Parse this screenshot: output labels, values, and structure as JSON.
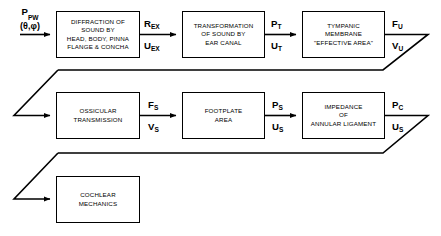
{
  "figure": {
    "background_color": "#ffffff",
    "line_color": "#000000"
  },
  "input": {
    "symbol": "P",
    "symbol_sub": "PW",
    "angles": "(θ,φ)"
  },
  "blocks": [
    {
      "id": "diffraction",
      "label": "DIFFRACTION OF\nSOUND BY\nHEAD, BODY, PINNA\nFLANGE & CONCHA",
      "row": 1
    },
    {
      "id": "transformation",
      "label": "TRANSFORMATION\nOF SOUND BY\nEAR CANAL",
      "row": 1
    },
    {
      "id": "tympanic-membrane",
      "label": "TYMPANIC\nMEMBRANE\n\"EFFECTIVE AREA\"",
      "row": 1
    },
    {
      "id": "ossicular-transmission",
      "label": "OSSICULAR\nTRANSMISSION",
      "row": 2
    },
    {
      "id": "footplate-area",
      "label": "FOOTPLATE\nAREA",
      "row": 2
    },
    {
      "id": "annular-ligament",
      "label": "IMPEDANCE\nOF\nANNULAR LIGAMENT",
      "row": 2
    },
    {
      "id": "cochlear-mechanics",
      "label": "COCHLEAR\nMECHANICS",
      "row": 3
    }
  ],
  "signals": [
    {
      "id": "r-ex",
      "top_symbol": "R",
      "top_sub": "EX",
      "bottom_symbol": "U",
      "bottom_sub": "EX"
    },
    {
      "id": "p-t",
      "top_symbol": "P",
      "top_sub": "T",
      "bottom_symbol": "U",
      "bottom_sub": "T"
    },
    {
      "id": "f-u",
      "top_symbol": "F",
      "top_sub": "U",
      "bottom_symbol": "V",
      "bottom_sub": "U"
    },
    {
      "id": "f-s",
      "top_symbol": "F",
      "top_sub": "S",
      "bottom_symbol": "V",
      "bottom_sub": "S"
    },
    {
      "id": "p-s",
      "top_symbol": "P",
      "top_sub": "S",
      "bottom_symbol": "U",
      "bottom_sub": "S"
    },
    {
      "id": "p-c",
      "top_symbol": "P",
      "top_sub": "C",
      "bottom_symbol": "U",
      "bottom_sub": "S"
    }
  ]
}
